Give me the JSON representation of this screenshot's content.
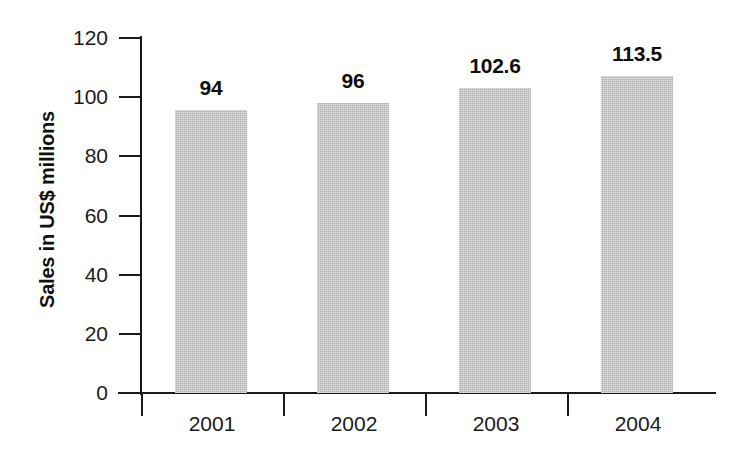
{
  "chart_data": {
    "type": "bar",
    "title": "",
    "xlabel": "",
    "ylabel": "Sales in US$ millions",
    "categories": [
      "2001",
      "2002",
      "2003",
      "2004"
    ],
    "values": [
      94,
      96,
      102.6,
      113.5
    ],
    "value_labels": [
      "94",
      "96",
      "102.6",
      "113.5"
    ],
    "ylim": [
      0,
      120
    ],
    "yticks": [
      0,
      20,
      40,
      60,
      80,
      100,
      120
    ],
    "ytick_labels": [
      "0",
      "20",
      "40",
      "60",
      "80",
      "100",
      "120"
    ],
    "grid": false,
    "legend": false,
    "legend_position": "none",
    "series": [
      {
        "name": "Sales",
        "values": [
          94,
          96,
          102.6,
          113.5
        ]
      }
    ],
    "bar_plotted_heights": [
      95.6,
      98.0,
      103.0,
      107.0
    ],
    "colors": {
      "bar_fill": "#c6c6c6",
      "axis": "#1a1a1a",
      "text": "#0d0d0d",
      "background": "#ffffff"
    }
  },
  "axis": {
    "y_title": "Sales in US$ millions"
  }
}
